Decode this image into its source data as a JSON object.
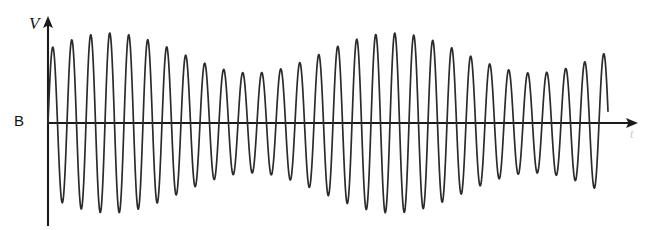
{
  "figure": {
    "background_color": "#ffffff",
    "width": 648,
    "height": 230
  },
  "axes": {
    "vertical": {
      "label": "V",
      "label_style": "italic",
      "x": 48,
      "y_top": 18,
      "y_bottom": 226,
      "arrow": "up",
      "color": "#1b1b1b"
    },
    "horizontal": {
      "label": "t",
      "label_style": "italic",
      "y": 123,
      "x_start": 48,
      "x_end": 637,
      "arrow": "right",
      "color": "#1b1b1b"
    },
    "origin_label": "B",
    "origin_label_color": "#151515"
  },
  "chart_data": {
    "type": "line",
    "title": "",
    "subtitle": "",
    "xlabel": "t",
    "ylabel": "V",
    "grid": false,
    "legend": null,
    "annotations": [
      {
        "text": "V",
        "role": "y-axis-label",
        "x": 34,
        "y": 24
      },
      {
        "text": "B",
        "role": "origin-label",
        "x": 20,
        "y": 122
      },
      {
        "text": "t",
        "role": "x-axis-label",
        "x": 633,
        "y": 134
      }
    ],
    "xlim": [
      0,
      560
    ],
    "ylim": [
      -100,
      100
    ],
    "series": [
      {
        "name": "V(t)",
        "description": "Amplitude-modulated sinusoid (beats): carrier modulated by slower envelope producing two amplitude maxima and two amplitude minima across the trace",
        "stroke_color": "#2b2b2b",
        "stroke_width": 1.7,
        "carrier_period_px": 19.0,
        "carrier_cycles": 29.5,
        "phase_start_deg": 0,
        "envelope": {
          "type": "beat",
          "max_amplitude_px": 90,
          "min_amplitude_px": 50,
          "beat_period_px": 283,
          "beat_phase_px": 110,
          "maxima_x_px": [
            110,
            400
          ],
          "minima_x_px": [
            265,
            545
          ]
        },
        "x_start_px": 48,
        "x_end_px": 608,
        "baseline_y_px": 123
      }
    ]
  }
}
